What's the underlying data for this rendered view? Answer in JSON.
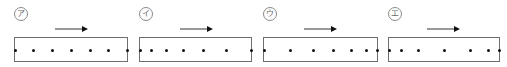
{
  "figure": {
    "panels": [
      {
        "label": "ア",
        "box_left": 14,
        "box_width": 114,
        "arrow_x": 55,
        "dots": [
          1,
          19,
          38,
          57,
          76,
          94,
          113
        ],
        "motion": "uniform"
      },
      {
        "label": "イ",
        "box_left": 139,
        "box_width": 113,
        "arrow_x": 180,
        "dots": [
          1,
          12,
          27,
          44,
          64,
          87,
          112
        ],
        "motion": "accelerating"
      },
      {
        "label": "ウ",
        "box_left": 263,
        "box_width": 115,
        "arrow_x": 304,
        "dots": [
          1,
          27,
          50,
          70,
          88,
          103,
          114
        ],
        "motion": "decelerating"
      },
      {
        "label": "エ",
        "box_left": 388,
        "box_width": 112,
        "arrow_x": 427,
        "dots": [
          1,
          13,
          30,
          56,
          82,
          100,
          111
        ],
        "motion": "accelerate-then-decelerate"
      }
    ],
    "arrow_direction": "right",
    "arrow_length": 33
  }
}
